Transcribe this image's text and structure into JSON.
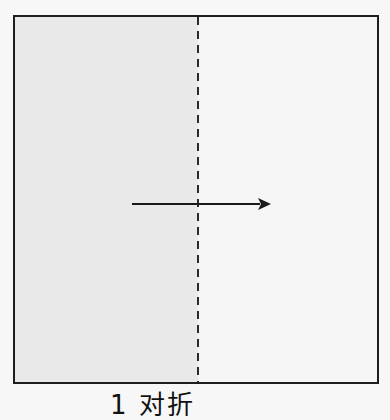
{
  "diagram": {
    "caption": "1 对折",
    "step_number": "1",
    "step_label": "对折",
    "paper": {
      "left_half_color": "#e9e9e9",
      "right_half_color": "#f5f5f5",
      "border_color": "#1e1e1e"
    },
    "fold_line": {
      "style": "dashed",
      "orientation": "vertical",
      "position": "center"
    },
    "arrow": {
      "direction": "right",
      "icon": "arrow-right-icon"
    }
  }
}
